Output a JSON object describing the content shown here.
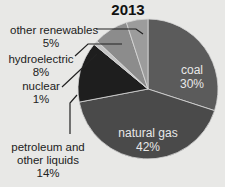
{
  "chart_data": {
    "type": "pie",
    "title": "2013",
    "start_angle_deg": 0,
    "direction": "clockwise",
    "slices": [
      {
        "label": "coal",
        "value": 30,
        "display": "30%",
        "color": "#5b5b5b",
        "label_position": "inside"
      },
      {
        "label": "natural gas",
        "value": 42,
        "display": "42%",
        "color": "#4a4a4a",
        "label_position": "inside"
      },
      {
        "label": "petroleum and other liquids",
        "value": 14,
        "display": "14%",
        "color": "#1e1e1e",
        "label_position": "outside"
      },
      {
        "label": "nuclear",
        "value": 1,
        "display": "1%",
        "color": "#c4c4c4",
        "label_position": "outside"
      },
      {
        "label": "hydroelectric",
        "value": 8,
        "display": "8%",
        "color": "#8c8c8c",
        "label_position": "outside"
      },
      {
        "label": "other renewables",
        "value": 5,
        "display": "5%",
        "color": "#9c9c9c",
        "label_position": "outside"
      }
    ],
    "legend": "none"
  },
  "labels": {
    "title": "2013",
    "coal_name": "coal",
    "coal_pct": "30%",
    "gas_name": "natural gas",
    "gas_pct": "42%",
    "petro_line1": "petroleum and",
    "petro_line2": "other liquids",
    "petro_pct": "14%",
    "nuclear_name": "nuclear",
    "nuclear_pct": "1%",
    "hydro_name": "hydroelectric",
    "hydro_pct": "8%",
    "other_name": "other renewables",
    "other_pct": "5%"
  }
}
